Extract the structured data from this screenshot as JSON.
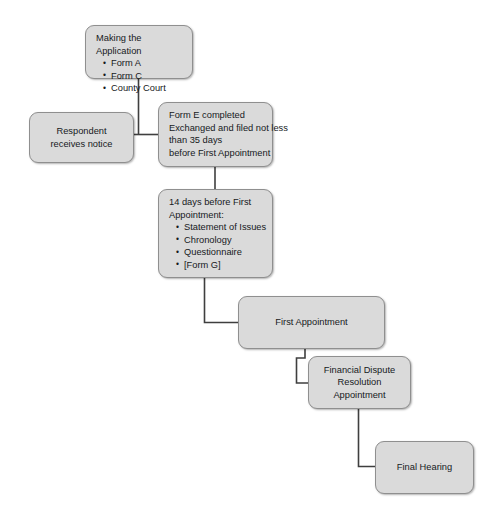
{
  "diagram": {
    "style": {
      "node_fill": "#dadada",
      "node_border": "#8f8f8f",
      "connector_color": "#3f3f3f",
      "background": "#ffffff",
      "text_color": "#16191c"
    },
    "nodes": [
      {
        "id": "making-the-application",
        "heading": "Making the Application",
        "bullets": [
          "Form A",
          "Form C",
          "County Court"
        ]
      },
      {
        "id": "respondent-receives-notice",
        "lines": [
          "Respondent",
          "receives notice"
        ]
      },
      {
        "id": "form-e-completed",
        "lines": [
          "Form E completed",
          "Exchanged and filed not less",
          "than 35 days",
          "before First Appointment"
        ]
      },
      {
        "id": "fourteen-days-before-first-appointment",
        "heading": "14 days before First\nAppointment:",
        "bullets": [
          "Statement of Issues",
          "Chronology",
          "Questionnaire",
          "[Form G]"
        ]
      },
      {
        "id": "first-appointment",
        "lines": [
          "First Appointment"
        ]
      },
      {
        "id": "financial-dispute-resolution-appointment",
        "lines": [
          "Financial Dispute",
          "Resolution",
          "Appointment"
        ]
      },
      {
        "id": "final-hearing",
        "lines": [
          "Final Hearing"
        ]
      }
    ]
  }
}
